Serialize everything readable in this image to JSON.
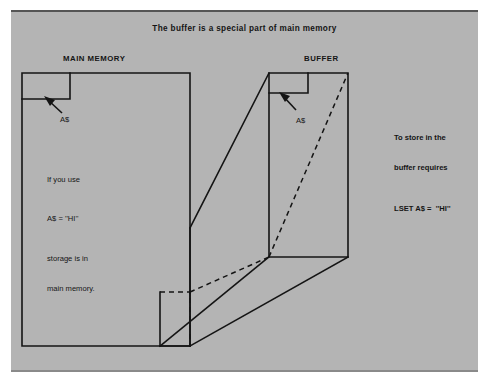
{
  "figure": {
    "title": "The buffer is a special part of main memory",
    "background_color": "#b4b4b4",
    "line_color": "#141414"
  },
  "labels": {
    "main_memory": "MAIN MEMORY",
    "buffer": "BUFFER",
    "as_main": "A$",
    "as_buffer": "A$"
  },
  "notes": {
    "main_memory_note": {
      "line1": "If you use",
      "line2": "A$ = ''HI''",
      "line3": "storage is in",
      "line4": "main memory."
    },
    "buffer_note": {
      "line1": "To store in the",
      "line2": "buffer requires",
      "line3": "LSET A$ =  ''HI''"
    }
  },
  "diagram": {
    "main_memory_box": {
      "x": 22,
      "y": 73,
      "width": 168,
      "height": 273
    },
    "main_memory_as_cell": {
      "x": 22,
      "y": 73,
      "width": 48,
      "height": 26
    },
    "buffer_box": {
      "x": 269,
      "y": 73,
      "width": 79,
      "height": 184
    },
    "buffer_as_cell": {
      "x": 269,
      "y": 73,
      "width": 39,
      "height": 20
    },
    "projected_box": {
      "x": 160,
      "y": 292,
      "width": 30,
      "height": 54
    },
    "dashed_diagonal": "buffer bottom-left to buffer top-right",
    "arrow_main": "points up-left to A$ cell in main memory",
    "arrow_buffer": "points up-left to A$ cell in buffer"
  }
}
